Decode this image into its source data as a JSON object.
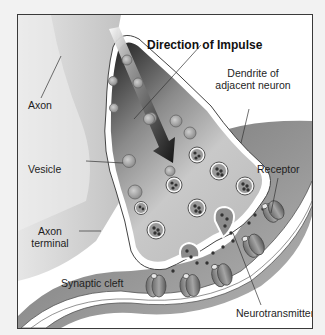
{
  "diagram": {
    "title": "Direction of Impulse",
    "labels": {
      "axon": "Axon",
      "vesicle": "Vesicle",
      "axon_terminal_line1": "Axon",
      "axon_terminal_line2": "terminal",
      "synaptic_cleft": "Synaptic cleft",
      "dendrite_line1": "Dendrite of",
      "dendrite_line2": "adjacent neuron",
      "receptor": "Receptor",
      "neurotransmitter": "Neurotransmitter"
    },
    "colors": {
      "frame": "#3a3a3a",
      "axon_fill": "#d9d9d9",
      "terminal_dark": "#2a2a2a",
      "terminal_light": "#c8c8c8",
      "dendrite_fill": "#8a8a8a",
      "arrow": "#1a1a1a"
    }
  }
}
